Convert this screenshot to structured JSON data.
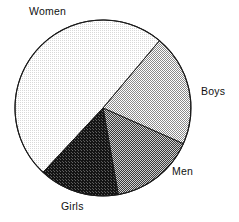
{
  "chart_data": {
    "type": "pie",
    "title": "",
    "subtitle": "",
    "xlabel": "",
    "ylabel": "",
    "grid": false,
    "legend_position": "outside-labels",
    "start_angle_deg": 223,
    "direction": "clockwise",
    "categories": [
      "Women",
      "Boys",
      "Men",
      "Girls"
    ],
    "values": [
      49.2,
      20.6,
      15.5,
      14.7
    ],
    "units": "percent",
    "slices": [
      {
        "label": "Women",
        "value": 49.2,
        "start_angle_deg": 223,
        "end_angle_deg": 400,
        "sweep_deg": 177,
        "fill_pattern": "very-light-dither",
        "fill_color": "#efefef",
        "label_position": "top-left-outside"
      },
      {
        "label": "Boys",
        "value": 20.6,
        "start_angle_deg": 40,
        "end_angle_deg": 114,
        "sweep_deg": 74,
        "fill_pattern": "light-checker-dither",
        "fill_color": "#d5d5d5",
        "label_position": "right-outside"
      },
      {
        "label": "Men",
        "value": 15.5,
        "start_angle_deg": 114,
        "end_angle_deg": 170,
        "sweep_deg": 56,
        "fill_pattern": "medium-dark-checker-dither",
        "fill_color": "#6f6f6f",
        "label_position": "bottom-right-outside"
      },
      {
        "label": "Girls",
        "value": 14.7,
        "start_angle_deg": 170,
        "end_angle_deg": 223,
        "sweep_deg": 53,
        "fill_pattern": "near-solid-dark-dither",
        "fill_color": "#282828",
        "label_position": "bottom-outside"
      }
    ],
    "geometry": {
      "center_x": 103,
      "center_y": 108,
      "radius": 88,
      "outline_color": "#1a1a1a",
      "outline_width": 1,
      "background_color": "#ffffff"
    }
  },
  "labels": {
    "women": "Women",
    "boys": "Boys",
    "men": "Men",
    "girls": "Girls"
  }
}
